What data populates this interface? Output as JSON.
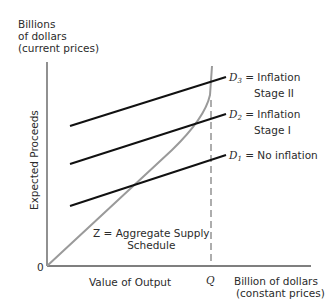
{
  "y_axis": {
    "label_lines": [
      "Billions",
      "of dollars",
      "(current prices)"
    ],
    "title": "Expected Proceeds"
  },
  "x_axis": {
    "title": "Value of Output",
    "origin": "0",
    "q_marker": "Q",
    "unit_lines": [
      "Billion of dollars",
      "(constant prices)"
    ]
  },
  "curves": {
    "d3": {
      "symbol": "D",
      "sub": "3",
      "text": "= Inflation",
      "text2": "Stage II"
    },
    "d2": {
      "symbol": "D",
      "sub": "2",
      "text": "= Inflation",
      "text2": "Stage I"
    },
    "d1": {
      "symbol": "D",
      "sub": "1",
      "text": "= No inflation"
    },
    "z": {
      "text": "Z = Aggregate Supply",
      "text2": "Schedule"
    }
  },
  "colors": {
    "axis": "#555555",
    "demand": "#111111",
    "supply": "#9a9a9a",
    "dashed": "#777777"
  }
}
